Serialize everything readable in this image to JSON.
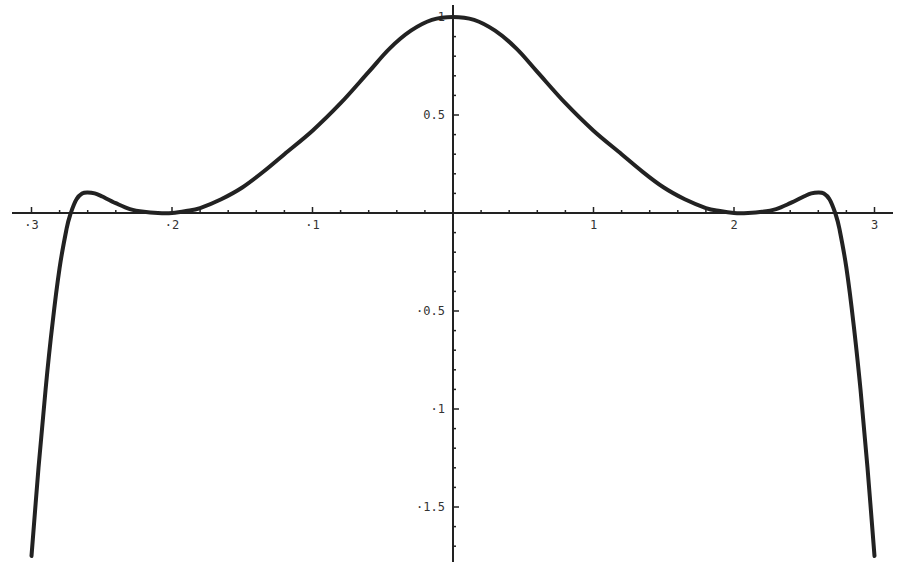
{
  "chart_data": {
    "type": "line",
    "title": "",
    "xlabel": "",
    "ylabel": "",
    "xlim": [
      -3,
      3
    ],
    "ylim": [
      -1.75,
      1.0
    ],
    "grid": false,
    "legend": null,
    "x_ticks": [
      "-3",
      "-2",
      "-1",
      "1",
      "2",
      "3"
    ],
    "y_ticks": [
      "1",
      "0.5",
      "-0.5",
      "-1",
      "-1.5"
    ],
    "series": [
      {
        "name": "f(x)",
        "x": [
          -3.0,
          -2.95,
          -2.9,
          -2.85,
          -2.8,
          -2.75,
          -2.72,
          -2.68,
          -2.64,
          -2.6,
          -2.55,
          -2.5,
          -2.4,
          -2.3,
          -2.2,
          -2.1,
          -2.0,
          -1.9,
          -1.8,
          -1.65,
          -1.5,
          -1.35,
          -1.2,
          -1.0,
          -0.8,
          -0.6,
          -0.45,
          -0.3,
          -0.15,
          0.0,
          0.15,
          0.3,
          0.45,
          0.6,
          0.8,
          1.0,
          1.2,
          1.35,
          1.5,
          1.65,
          1.8,
          1.9,
          2.0,
          2.1,
          2.2,
          2.3,
          2.4,
          2.5,
          2.55,
          2.6,
          2.64,
          2.68,
          2.72,
          2.75,
          2.8,
          2.85,
          2.9,
          2.95,
          3.0
        ],
        "values": [
          -1.75,
          -1.3,
          -0.9,
          -0.56,
          -0.28,
          -0.08,
          0.0,
          0.07,
          0.1,
          0.105,
          0.1,
          0.085,
          0.05,
          0.02,
          0.006,
          0.0,
          0.0,
          0.01,
          0.025,
          0.07,
          0.13,
          0.21,
          0.3,
          0.42,
          0.56,
          0.72,
          0.84,
          0.93,
          0.985,
          1.0,
          0.985,
          0.93,
          0.84,
          0.72,
          0.56,
          0.42,
          0.3,
          0.21,
          0.13,
          0.07,
          0.025,
          0.01,
          0.0,
          0.0,
          0.006,
          0.02,
          0.05,
          0.085,
          0.1,
          0.105,
          0.1,
          0.07,
          0.0,
          -0.08,
          -0.28,
          -0.56,
          -0.9,
          -1.3,
          -1.75
        ]
      }
    ]
  },
  "style": {
    "line_color": "#222222",
    "axis_color": "#222222",
    "background": "#ffffff"
  }
}
